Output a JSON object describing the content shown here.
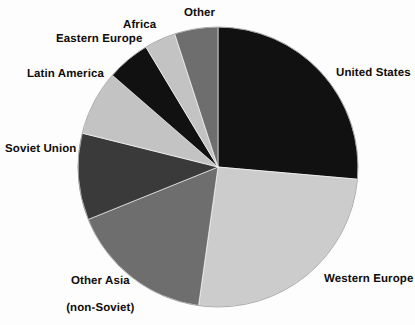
{
  "chart_data": {
    "type": "pie",
    "title": "",
    "subtitle": "",
    "xlabel": "",
    "ylabel": "",
    "legend_position": "none",
    "grid": false,
    "labels_position": "outside",
    "start_angle_deg": 0,
    "direction": "clockwise",
    "categories": [
      "United States",
      "Western Europe",
      "Other Asia (non-Soviet)",
      "Soviet Union",
      "Latin America",
      "Eastern Europe",
      "Africa",
      "Other"
    ],
    "values": [
      26.5,
      26.0,
      16.5,
      10.0,
      7.5,
      5.0,
      3.5,
      5.0
    ],
    "slices": [
      {
        "label": "United States",
        "value": 26.5,
        "start_deg": 0,
        "end_deg": 95,
        "color": "#111111"
      },
      {
        "label": "Western Europe",
        "value": 26.0,
        "start_deg": 95,
        "end_deg": 188,
        "color": "#cccccc"
      },
      {
        "label": "Other Asia (non-Soviet)",
        "value": 16.5,
        "start_deg": 188,
        "end_deg": 248,
        "color": "#6e6e6e"
      },
      {
        "label": "Soviet Union",
        "value": 10.0,
        "start_deg": 248,
        "end_deg": 284,
        "color": "#3a3a3a"
      },
      {
        "label": "Latin America",
        "value": 7.5,
        "start_deg": 284,
        "end_deg": 311,
        "color": "#c3c3c3"
      },
      {
        "label": "Eastern Europe",
        "value": 5.0,
        "start_deg": 311,
        "end_deg": 329,
        "color": "#111111"
      },
      {
        "label": "Africa",
        "value": 3.5,
        "start_deg": 329,
        "end_deg": 342,
        "color": "#c3c3c3"
      },
      {
        "label": "Other",
        "value": 5.0,
        "start_deg": 342,
        "end_deg": 360,
        "color": "#6e6e6e"
      }
    ]
  },
  "labels": {
    "united_states": "United States",
    "western_europe": "Western Europe",
    "other_asia_line1": "Other Asia",
    "other_asia_line2": "(non-Soviet)",
    "soviet_union": "Soviet Union",
    "latin_america": "Latin America",
    "eastern_europe": "Eastern Europe",
    "africa": "Africa",
    "other": "Other"
  },
  "geometry": {
    "center_x": 218,
    "center_y": 167,
    "radius": 140
  },
  "colors": {
    "background": "#fdfdfd",
    "text": "#100c08",
    "black_slice": "#111111",
    "dark_gray_slice": "#3a3a3a",
    "mid_gray_slice": "#6e6e6e",
    "light_gray_slice": "#c8c8c8",
    "outline": "#9a9a9a"
  }
}
